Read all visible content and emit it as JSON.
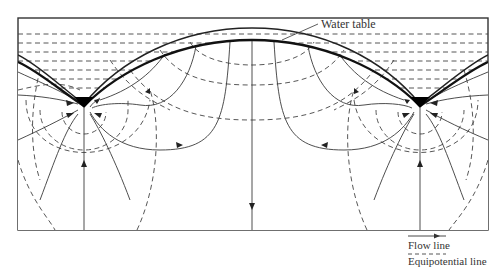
{
  "diagram": {
    "callout": {
      "label": "Water table"
    },
    "legend": {
      "items": [
        {
          "symbol": "solid-line-with-arrow",
          "label": "Flow line"
        },
        {
          "symbol": "dashed-line",
          "label": "Equipotential line"
        },
        {
          "symbol": "thick-solid-line",
          "label": "Water table"
        }
      ]
    },
    "features": {
      "streams": [
        "left-stream",
        "right-stream"
      ],
      "groundwater_divide": "center",
      "colors": {
        "line": "#333333",
        "water_table": "#111111",
        "stream": "#000000",
        "background": "#ffffff"
      }
    }
  }
}
